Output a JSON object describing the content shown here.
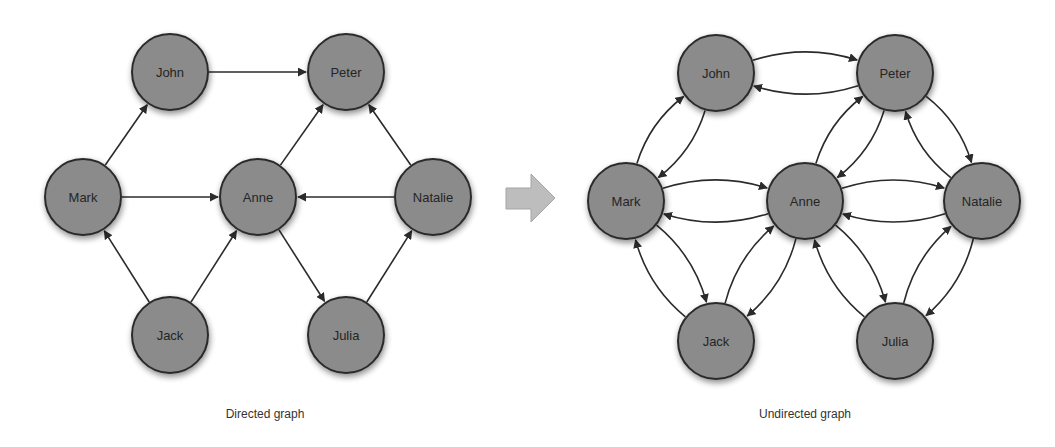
{
  "figure": {
    "left": {
      "caption": "Directed graph",
      "nodes": [
        {
          "id": "John",
          "label": "John",
          "x": 170,
          "y": 72
        },
        {
          "id": "Peter",
          "label": "Peter",
          "x": 346,
          "y": 72
        },
        {
          "id": "Mark",
          "label": "Mark",
          "x": 83,
          "y": 197
        },
        {
          "id": "Anne",
          "label": "Anne",
          "x": 258,
          "y": 197
        },
        {
          "id": "Natalie",
          "label": "Natalie",
          "x": 433,
          "y": 197
        },
        {
          "id": "Jack",
          "label": "Jack",
          "x": 170,
          "y": 335
        },
        {
          "id": "Julia",
          "label": "Julia",
          "x": 346,
          "y": 335
        }
      ],
      "edges": [
        {
          "from": "John",
          "to": "Peter"
        },
        {
          "from": "Mark",
          "to": "John"
        },
        {
          "from": "Mark",
          "to": "Anne"
        },
        {
          "from": "Anne",
          "to": "Peter"
        },
        {
          "from": "Natalie",
          "to": "Peter"
        },
        {
          "from": "Natalie",
          "to": "Anne"
        },
        {
          "from": "Jack",
          "to": "Mark"
        },
        {
          "from": "Jack",
          "to": "Anne"
        },
        {
          "from": "Anne",
          "to": "Julia"
        },
        {
          "from": "Julia",
          "to": "Natalie"
        }
      ]
    },
    "arrow": {
      "color": "#bdbdbd",
      "stroke": "#9a9a9a"
    },
    "right": {
      "caption": "Undirected graph",
      "nodes": [
        {
          "id": "John",
          "label": "John",
          "x": 716,
          "y": 73
        },
        {
          "id": "Peter",
          "label": "Peter",
          "x": 895,
          "y": 73
        },
        {
          "id": "Mark",
          "label": "Mark",
          "x": 626,
          "y": 201
        },
        {
          "id": "Anne",
          "label": "Anne",
          "x": 805,
          "y": 201
        },
        {
          "id": "Natalie",
          "label": "Natalie",
          "x": 982,
          "y": 201
        },
        {
          "id": "Jack",
          "label": "Jack",
          "x": 716,
          "y": 341
        },
        {
          "id": "Julia",
          "label": "Julia",
          "x": 895,
          "y": 341
        }
      ],
      "edges": [
        {
          "a": "John",
          "b": "Peter"
        },
        {
          "a": "John",
          "b": "Mark"
        },
        {
          "a": "Mark",
          "b": "Anne"
        },
        {
          "a": "Anne",
          "b": "Peter"
        },
        {
          "a": "Peter",
          "b": "Natalie"
        },
        {
          "a": "Anne",
          "b": "Natalie"
        },
        {
          "a": "Mark",
          "b": "Jack"
        },
        {
          "a": "Jack",
          "b": "Anne"
        },
        {
          "a": "Anne",
          "b": "Julia"
        },
        {
          "a": "Julia",
          "b": "Natalie"
        }
      ]
    },
    "node_radius": 38
  }
}
